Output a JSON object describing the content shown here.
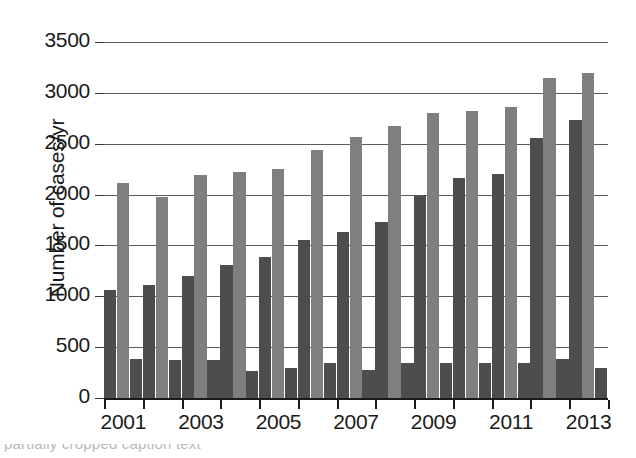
{
  "chart_data": {
    "type": "bar",
    "title": "",
    "subtitle": "",
    "xlabel": "",
    "ylabel": "Number of cases/yr",
    "ylim": [
      0,
      3500
    ],
    "ytick_interval": 500,
    "yticks": [
      "0",
      "500",
      "1000",
      "1500",
      "2000",
      "2500",
      "3000",
      "3500"
    ],
    "grid": true,
    "grid_axis": "y",
    "legend": "none",
    "legend_position": "none",
    "categories": [
      "2001",
      "2002",
      "2003",
      "2004",
      "2005",
      "2006",
      "2007",
      "2008",
      "2009",
      "2010",
      "2011",
      "2012",
      "2013"
    ],
    "xtick_labels_shown": [
      "2001",
      "2003",
      "2005",
      "2007",
      "2009",
      "2011",
      "2013"
    ],
    "series": [
      {
        "name": "series-1-dark",
        "color": "#4d4d4d",
        "values": [
          1060,
          1110,
          1200,
          1310,
          1390,
          1550,
          1630,
          1730,
          1990,
          2160,
          2200,
          2560,
          2730
        ]
      },
      {
        "name": "series-2-light",
        "color": "#7f7f7f",
        "values": [
          2110,
          1980,
          2190,
          2220,
          2250,
          2440,
          2570,
          2670,
          2800,
          2820,
          2860,
          3150,
          3200
        ]
      },
      {
        "name": "series-3-dark",
        "color": "#4d4d4d",
        "values": [
          380,
          370,
          370,
          270,
          300,
          340,
          280,
          340,
          340,
          340,
          340,
          380,
          300
        ]
      }
    ]
  },
  "caption": {
    "cropped_line": "partially cropped caption text"
  }
}
